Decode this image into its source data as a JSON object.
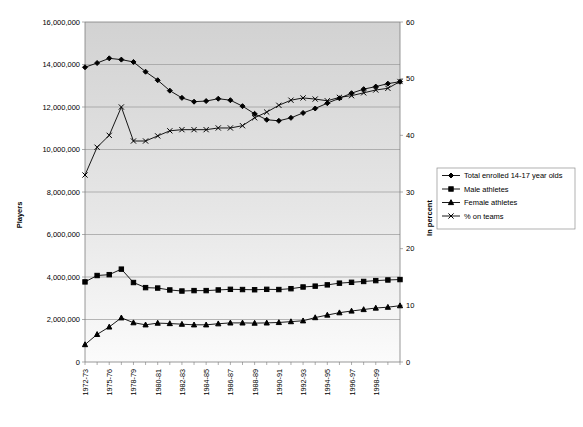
{
  "figure": {
    "ghost_title": "",
    "background": "#ffffff",
    "plot_background_top": "#d2d2d2",
    "plot_background_bottom": "#fbfbfb"
  },
  "axes": {
    "left": {
      "label": "Players",
      "min": 0,
      "max": 16000000,
      "step": 2000000,
      "ticks": [
        "0",
        "2,000,000",
        "4,000,000",
        "6,000,000",
        "8,000,000",
        "10,000,000",
        "12,000,000",
        "14,000,000",
        "16,000,000"
      ]
    },
    "right": {
      "label": "In percent",
      "min": 0,
      "max": 60,
      "step": 10,
      "ticks": [
        "0",
        "10",
        "20",
        "30",
        "40",
        "50",
        "60"
      ]
    },
    "x": {
      "label": "",
      "tick_labels": [
        "1972-73",
        "",
        "1975-76",
        "",
        "1978-79",
        "",
        "1980-81",
        "",
        "1982-83",
        "",
        "1984-85",
        "",
        "1986-87",
        "",
        "1988-89",
        "",
        "1990-91",
        "",
        "1992-93",
        "",
        "1994-95",
        "",
        "1996-97",
        "",
        "1998-99"
      ]
    }
  },
  "legend": {
    "position": "right-middle",
    "items": [
      {
        "label": "Total enrolled 14-17 year olds",
        "marker": "diamond",
        "color": "#000000"
      },
      {
        "label": "Male athletes",
        "marker": "square",
        "color": "#000000"
      },
      {
        "label": "Female athletes",
        "marker": "triangle",
        "color": "#000000"
      },
      {
        "label": "% on teams",
        "marker": "x",
        "color": "#000000"
      }
    ]
  },
  "chart_data": {
    "type": "line",
    "title": "",
    "xlabel": "",
    "ylabel": "Players",
    "y2label": "In percent",
    "ylim": [
      0,
      16000000
    ],
    "y2lim": [
      0,
      60
    ],
    "grid": true,
    "legend_position": "right",
    "categories": [
      "1972-73",
      "1973-74",
      "1974-75",
      "1975-76",
      "1976-77",
      "1977-78",
      "1978-79",
      "1979-80",
      "1980-81",
      "1981-82",
      "1982-83",
      "1983-84",
      "1984-85",
      "1985-86",
      "1986-87",
      "1987-88",
      "1988-89",
      "1989-90",
      "1990-91",
      "1991-92",
      "1992-93",
      "1993-94",
      "1994-95",
      "1995-96",
      "1996-97",
      "1997-98",
      "1998-99"
    ],
    "series": [
      {
        "name": "Total enrolled 14-17 year olds",
        "axis": "left",
        "marker": "diamond",
        "values": [
          13870000,
          14070000,
          14290000,
          14230000,
          14120000,
          13660000,
          13260000,
          12770000,
          12430000,
          12250000,
          12280000,
          12390000,
          12320000,
          12040000,
          11680000,
          11400000,
          11350000,
          11490000,
          11720000,
          11930000,
          12180000,
          12410000,
          12650000,
          12840000,
          12960000,
          13100000,
          13190000
        ]
      },
      {
        "name": "Male athletes",
        "axis": "left",
        "marker": "square",
        "values": [
          3770000,
          4070000,
          4110000,
          4370000,
          3740000,
          3500000,
          3480000,
          3390000,
          3340000,
          3360000,
          3360000,
          3390000,
          3420000,
          3410000,
          3400000,
          3420000,
          3410000,
          3450000,
          3530000,
          3570000,
          3630000,
          3710000,
          3750000,
          3790000,
          3830000,
          3860000,
          3880000
        ]
      },
      {
        "name": "Female athletes",
        "axis": "left",
        "marker": "triangle",
        "values": [
          820000,
          1300000,
          1650000,
          2080000,
          1850000,
          1750000,
          1830000,
          1810000,
          1780000,
          1750000,
          1750000,
          1800000,
          1840000,
          1840000,
          1830000,
          1840000,
          1860000,
          1900000,
          1940000,
          2090000,
          2210000,
          2320000,
          2400000,
          2470000,
          2540000,
          2580000,
          2650000
        ]
      },
      {
        "name": "% on teams",
        "axis": "right",
        "marker": "x",
        "values": [
          33.0,
          37.9,
          40.0,
          45.0,
          39.0,
          39.0,
          39.9,
          40.8,
          41.0,
          41.0,
          41.0,
          41.3,
          41.3,
          41.7,
          43.1,
          44.1,
          45.3,
          46.2,
          46.6,
          46.4,
          46.1,
          46.7,
          47.0,
          47.5,
          48.0,
          48.3,
          49.5
        ]
      }
    ]
  }
}
